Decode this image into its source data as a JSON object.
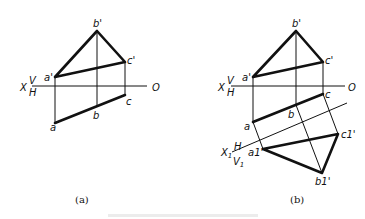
{
  "figures": {
    "a": {
      "caption": "(a)",
      "axis": {
        "x_label": "X",
        "v_label": "V",
        "h_label": "H",
        "o_label": "O"
      },
      "points": {
        "a_prime": "a'",
        "b_prime": "b'",
        "c_prime": "c'",
        "a": "a",
        "b": "b",
        "c": "c"
      }
    },
    "b": {
      "caption": "(b)",
      "axis": {
        "x_label": "X",
        "v_label": "V",
        "h_label": "H",
        "o_label": "O"
      },
      "axis1": {
        "x1_label": "X",
        "x1_sub": "1",
        "h_label": "H",
        "v1_label": "V",
        "v1_sub": "1"
      },
      "points": {
        "a_prime": "a'",
        "b_prime": "b'",
        "c_prime": "c'",
        "a": "a",
        "b": "b",
        "c": "c",
        "a1_prime": "a1'",
        "b1_prime": "b1'",
        "c1_prime": "c1'"
      }
    }
  },
  "footer_caption": ""
}
